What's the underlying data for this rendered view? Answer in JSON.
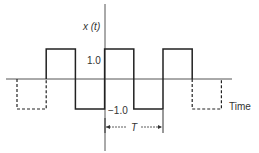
{
  "figure": {
    "type": "square-wave",
    "y_axis_label": "x (t)",
    "x_axis_label": "Time",
    "amplitude_high_label": "1.0",
    "amplitude_low_label": "−1.0",
    "period_label": "T",
    "amplitude_high": 1.0,
    "amplitude_low": -1.0,
    "solid_segments": [
      {
        "t0": -2.0,
        "t1": -1.5,
        "level": 1.0
      },
      {
        "t0": -1.5,
        "t1": -1.0,
        "level": -1.0
      },
      {
        "t0": -1.0,
        "t1": -0.5,
        "level": 1.0
      },
      {
        "t0": -0.5,
        "t1": 0.0,
        "level": -1.0
      },
      {
        "t0": 0.0,
        "t1": 0.5,
        "level": 1.0
      }
    ],
    "dashed_segments": [
      {
        "t0": -2.5,
        "t1": -2.0,
        "level": -1.0
      },
      {
        "t0": 0.5,
        "t1": 1.0,
        "level": -1.0
      }
    ],
    "period_marker": {
      "t0": -1.0,
      "t1": 0.0
    },
    "colors": {
      "line": "#222222",
      "axis": "#555555"
    }
  }
}
